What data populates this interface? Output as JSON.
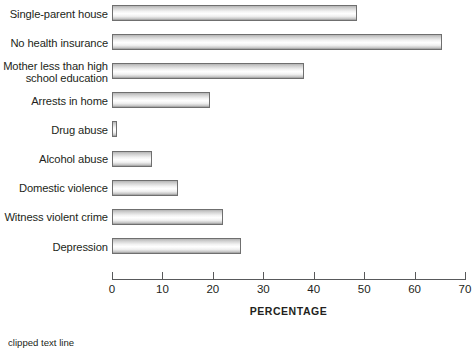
{
  "chart_data": {
    "type": "bar",
    "orientation": "horizontal",
    "title": "",
    "xlabel": "PERCENTAGE",
    "ylabel": "",
    "xlim": [
      0,
      70
    ],
    "xticks": [
      0,
      10,
      20,
      30,
      40,
      50,
      60,
      70
    ],
    "grid": false,
    "legend": null,
    "categories": [
      "Single-parent house",
      "No health insurance",
      "Mother less than high\nschool education",
      "Arrests in home",
      "Drug abuse",
      "Alcohol abuse",
      "Domestic violence",
      "Witness violent crime",
      "Depression"
    ],
    "values": [
      48.5,
      65.5,
      38,
      19.5,
      1,
      8,
      13,
      22,
      25.5
    ],
    "bars": [
      {
        "label": "Single-parent house",
        "value": 48.5
      },
      {
        "label": "No health insurance",
        "value": 65.5
      },
      {
        "label": "Mother less than high\nschool education",
        "value": 38
      },
      {
        "label": "Arrests in home",
        "value": 19.5
      },
      {
        "label": "Drug abuse",
        "value": 1
      },
      {
        "label": "Alcohol abuse",
        "value": 8
      },
      {
        "label": "Domestic violence",
        "value": 13
      },
      {
        "label": "Witness violent crime",
        "value": 22
      },
      {
        "label": "Depression",
        "value": 25.5
      }
    ],
    "colors": {
      "bar_fill_light": "#ffffff",
      "bar_fill_shade": "#b4b4b4",
      "bar_border": "#6f6f6f",
      "axis": "#58595b",
      "text": "#231f20"
    }
  },
  "caption": {
    "text": "clipped text line"
  }
}
